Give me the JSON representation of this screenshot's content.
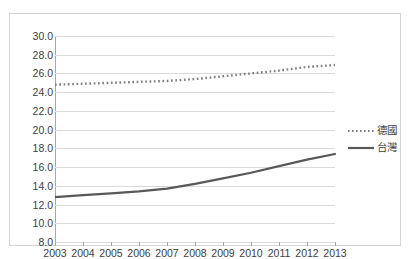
{
  "chart_data": {
    "type": "line",
    "title": "",
    "xlabel": "",
    "ylabel": "",
    "x": [
      2003,
      2004,
      2005,
      2006,
      2007,
      2008,
      2009,
      2010,
      2011,
      2012,
      2013
    ],
    "categories": [
      "2003",
      "2004",
      "2005",
      "2006",
      "2007",
      "2008",
      "2009",
      "2010",
      "2011",
      "2012",
      "2013"
    ],
    "ylim": [
      8.0,
      30.0
    ],
    "ytick_labels": [
      "30.0",
      "28.0",
      "26.0",
      "24.0",
      "22.0",
      "20.0",
      "18.0",
      "16.0",
      "14.0",
      "12.0",
      "10.0",
      "8.0"
    ],
    "ytick_values": [
      30.0,
      28.0,
      26.0,
      24.0,
      22.0,
      20.0,
      18.0,
      16.0,
      14.0,
      12.0,
      10.0,
      8.0
    ],
    "grid": true,
    "legend_position": "right",
    "series": [
      {
        "name": "德國",
        "style": "dotted",
        "color": "#808080",
        "values": [
          24.8,
          24.9,
          25.0,
          25.1,
          25.2,
          25.4,
          25.7,
          26.0,
          26.3,
          26.7,
          26.9
        ]
      },
      {
        "name": "台灣",
        "style": "solid",
        "color": "#595959",
        "values": [
          12.8,
          13.0,
          13.2,
          13.4,
          13.7,
          14.2,
          14.8,
          15.4,
          16.1,
          16.8,
          17.4
        ]
      }
    ]
  },
  "legend": {
    "items": [
      {
        "label": "德國",
        "key": "dotted-line-key"
      },
      {
        "label": "台灣",
        "key": "solid-line-key"
      }
    ]
  }
}
